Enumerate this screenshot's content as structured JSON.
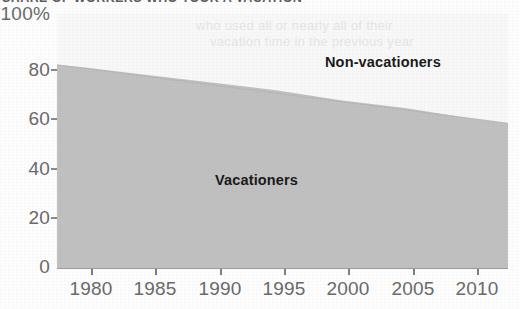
{
  "figure": {
    "title": "SHARE OF WORKERS WHO TOOK A VACATION",
    "title_note": "clipped at top edge of image",
    "ghost_text_line1": "who used all or nearly all of their",
    "ghost_text_line2": "vacation time in the previous year",
    "background_color": "#fdfdfd",
    "plot_background_color": "#f8f8f8"
  },
  "chart_data": {
    "type": "area",
    "stacked": true,
    "title": "SHARE OF WORKERS WHO TOOK A VACATION",
    "xlabel": "",
    "ylabel": "",
    "xlim": [
      1978,
      2013
    ],
    "ylim": [
      0,
      100
    ],
    "grid": false,
    "legend_position": "inside-plot-labels",
    "x_ticks": [
      1980,
      1985,
      1990,
      1995,
      2000,
      2005,
      2010
    ],
    "x_tick_labels": [
      "1980",
      "1985",
      "1990",
      "1995",
      "2000",
      "2005",
      "2010"
    ],
    "y_ticks": [
      0,
      20,
      40,
      60,
      80,
      100
    ],
    "y_tick_labels": [
      "0",
      "20",
      "40",
      "60",
      "80",
      "100%"
    ],
    "x": [
      1978,
      1980,
      1985,
      1990,
      1995,
      2000,
      2005,
      2010,
      2013
    ],
    "series": [
      {
        "name": "Vacationers",
        "color": "#c0c0c0",
        "values": [
          80,
          79,
          76,
          73,
          70,
          66,
          63,
          59,
          57
        ]
      },
      {
        "name": "Non-vacationers",
        "color": "#f8f8f8",
        "values": [
          20,
          21,
          24,
          27,
          30,
          34,
          37,
          41,
          43
        ]
      }
    ],
    "annotations": [
      {
        "text": "Non-vacationers",
        "x": 2002,
        "y": 82
      },
      {
        "text": "Vacationers",
        "x": 1992,
        "y": 38
      }
    ]
  },
  "axes": {
    "y_labels": [
      {
        "text": "100%",
        "value": 100
      },
      {
        "text": "80",
        "value": 80
      },
      {
        "text": "60",
        "value": 60
      },
      {
        "text": "40",
        "value": 40
      },
      {
        "text": "20",
        "value": 20
      },
      {
        "text": "0",
        "value": 0
      }
    ],
    "x_labels": [
      {
        "text": "1980",
        "value": 1980
      },
      {
        "text": "1985",
        "value": 1985
      },
      {
        "text": "1990",
        "value": 1990
      },
      {
        "text": "1995",
        "value": 1995
      },
      {
        "text": "2000",
        "value": 2000
      },
      {
        "text": "2005",
        "value": 2005
      },
      {
        "text": "2010",
        "value": 2010
      }
    ]
  },
  "labels": {
    "non_vacationers": "Non-vacationers",
    "vacationers": "Vacationers"
  },
  "colors": {
    "vacationers_fill": "#c0c0c0",
    "non_vacationers_fill": "#f8f8f8",
    "axis": "#8a8a8a",
    "tick_text": "#6a6a6a",
    "series_label_text": "#1a1a1a"
  }
}
